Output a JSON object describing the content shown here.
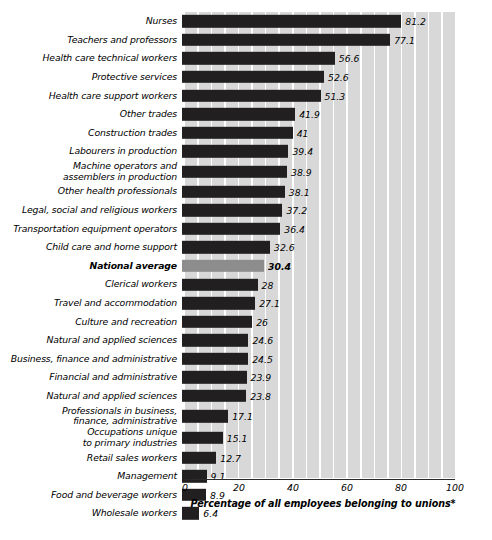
{
  "chart_data": {
    "type": "bar",
    "orientation": "horizontal",
    "title": "",
    "xlabel": "Percentage of all employees belonging to unions*",
    "ylabel": "",
    "xlim": [
      0,
      100
    ],
    "xticks": [
      0,
      20,
      40,
      60,
      80,
      100
    ],
    "grid": "vertical-bands",
    "legend": "none",
    "highlight_category": "National average",
    "highlight_color": "#8d8d8d",
    "bar_color": "#211f1f",
    "band_color": "#d8d8d8",
    "categories": [
      "Nurses",
      "Teachers and professors",
      "Health care technical workers",
      "Protective services",
      "Health care support workers",
      "Other trades",
      "Construction trades",
      "Labourers in production",
      "Machine operators and\nassemblers in production",
      "Other health professionals",
      "Legal, social and religious workers",
      "Transportation equipment operators",
      "Child care and home support",
      "National average",
      "Clerical workers",
      "Travel and accommodation",
      "Culture and recreation",
      "Natural and applied sciences",
      "Business, finance and administrative",
      "Financial and administrative",
      "Natural and applied sciences",
      "Professionals in business,\nfinance, administrative",
      "Occupations unique\nto primary industries",
      "Retail sales workers",
      "Management",
      "Food and beverage workers",
      "Wholesale workers"
    ],
    "values": [
      81.2,
      77.1,
      56.6,
      52.6,
      51.3,
      41.9,
      41,
      39.4,
      38.9,
      38.1,
      37.2,
      36.4,
      32.6,
      30.4,
      28,
      27.1,
      26,
      24.6,
      24.5,
      23.9,
      23.8,
      17.1,
      15.1,
      12.7,
      9.1,
      8.9,
      6.4
    ],
    "value_labels": [
      "81.2",
      "77.1",
      "56.6",
      "52.6",
      "51.3",
      "41.9",
      "41",
      "39.4",
      "38.9",
      "38.1",
      "37.2",
      "36.4",
      "32.6",
      "30.4",
      "28",
      "27.1",
      "26",
      "24.6",
      "24.5",
      "23.9",
      "23.8",
      "17.1",
      "15.1",
      "12.7",
      "9.1",
      "8.9",
      "6.4"
    ],
    "two_line_rows": [
      8,
      21,
      22
    ]
  }
}
